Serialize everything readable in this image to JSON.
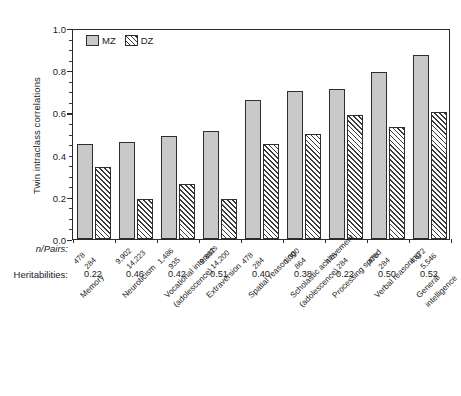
{
  "chart_data": {
    "type": "bar",
    "title": "",
    "xlabel": "",
    "ylabel": "Twin intraclass correlations",
    "ylim": [
      0.0,
      1.0
    ],
    "ytick_labels": [
      "0.0",
      "0.2",
      "0.4",
      "0.6",
      "0.8",
      "1.0"
    ],
    "ytick_values": [
      0.0,
      0.2,
      0.4,
      0.6,
      0.8,
      1.0
    ],
    "grid": false,
    "legend_position": "top-left-inside",
    "categories": [
      "Memory",
      "Neuroticism",
      "Vocational interests (adolescence)",
      "Extraversion",
      "Spatial reasoning",
      "Scholastic achievement (adolescence)",
      "Processing speed",
      "Verbal reasoning",
      "General intelligence"
    ],
    "series": [
      {
        "name": "MZ",
        "values": [
          0.45,
          0.46,
          0.49,
          0.51,
          0.66,
          0.7,
          0.71,
          0.79,
          0.87
        ]
      },
      {
        "name": "DZ",
        "values": [
          0.34,
          0.19,
          0.26,
          0.19,
          0.45,
          0.5,
          0.59,
          0.53,
          0.6
        ]
      }
    ],
    "annotations": {
      "npairs_row_label": "n/Pairs:",
      "heritability_row_label": "Heritabilities:",
      "npairs_mz": [
        "478",
        "9,902",
        "1,486",
        "9,887",
        "478",
        "1,300",
        "478",
        "478",
        "4,672"
      ],
      "npairs_dz": [
        "284",
        "14,223",
        "935",
        "14,200",
        "284",
        "864",
        "284",
        "284",
        "5,546"
      ],
      "heritabilities": [
        "0.22",
        "0.46",
        "0.42",
        "0.51",
        "0.40",
        "0.38",
        "0.22",
        "0.50",
        "0.52"
      ]
    }
  },
  "legend": {
    "items": [
      {
        "label": "MZ",
        "swatch": "solid-gray"
      },
      {
        "label": "DZ",
        "swatch": "hatched"
      }
    ]
  },
  "category_label_lines": [
    [
      "Memory",
      ""
    ],
    [
      "Neuroticism",
      ""
    ],
    [
      "Vocational interests",
      "(adolescence)"
    ],
    [
      "Extraversion",
      ""
    ],
    [
      "Spatial reasoning",
      ""
    ],
    [
      "Scholastic achievement",
      "(adolescence)"
    ],
    [
      "Processing speed",
      ""
    ],
    [
      "Verbal reasoning",
      ""
    ],
    [
      "General",
      "intelligence"
    ]
  ]
}
